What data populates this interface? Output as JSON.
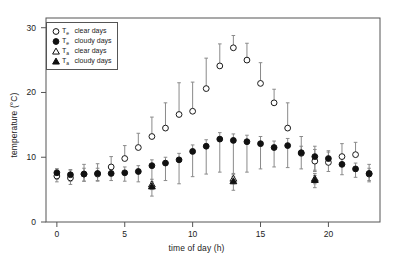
{
  "chart_data": {
    "type": "scatter",
    "title": "",
    "xlabel": "time of day (h)",
    "ylabel": "temperature (°C)",
    "xlim": [
      -0.8,
      23.8
    ],
    "ylim": [
      0,
      31.5
    ],
    "xticks": [
      0,
      5,
      10,
      15,
      20
    ],
    "yticks": [
      0,
      10,
      20,
      30
    ],
    "xtick_labels": [
      "0",
      "5",
      "10",
      "15",
      "20"
    ],
    "ytick_labels": [
      "0",
      "10",
      "20",
      "30"
    ],
    "grid": false,
    "legend_position": "upper-left-inside",
    "error_bars": "asymmetric vertical whisker extending upward from each marker",
    "series": [
      {
        "name": "T_e clear days",
        "label_symbol": "T",
        "label_subscript": "e",
        "label_rest": "clear days",
        "marker": "open-circle",
        "color": "#1a1a1a",
        "fill": "none",
        "x": [
          0,
          1,
          2,
          3,
          4,
          5,
          6,
          7,
          8,
          9,
          10,
          11,
          12,
          13,
          14,
          15,
          16,
          17,
          18,
          19,
          20,
          21,
          22,
          23
        ],
        "values": [
          7.1,
          6.8,
          7.4,
          7.4,
          8.5,
          9.8,
          11.5,
          13.2,
          14.5,
          16.6,
          17.1,
          20.6,
          24.1,
          26.9,
          25.0,
          21.4,
          18.4,
          14.5,
          10.6,
          9.4,
          9.2,
          10.1,
          10.4,
          7.4
        ],
        "err_up": [
          1.1,
          1.3,
          1.5,
          1.6,
          1.6,
          2.0,
          2.2,
          3.0,
          3.9,
          4.9,
          4.5,
          4.7,
          3.4,
          1.9,
          2.6,
          3.2,
          2.1,
          3.9,
          2.6,
          2.3,
          1.8,
          2.0,
          1.9,
          1.5
        ],
        "err_dn": [
          0.9,
          1.0,
          1.1,
          1.1,
          1.0,
          0.0,
          0.0,
          0.0,
          0.0,
          0.0,
          0.0,
          0.0,
          0.0,
          0.0,
          0.0,
          0.0,
          0.0,
          0.0,
          0.0,
          1.4,
          0.0,
          0.0,
          0.0,
          1.2
        ]
      },
      {
        "name": "T_e cloudy days",
        "label_symbol": "T",
        "label_subscript": "e",
        "label_rest": "cloudy days",
        "marker": "filled-circle",
        "color": "#111111",
        "fill": "#111111",
        "x": [
          0,
          1,
          2,
          3,
          4,
          5,
          6,
          7,
          8,
          9,
          10,
          11,
          12,
          13,
          14,
          15,
          16,
          17,
          18,
          19,
          20,
          21,
          22,
          23
        ],
        "values": [
          7.6,
          7.3,
          7.4,
          7.5,
          7.5,
          7.6,
          7.8,
          8.7,
          9.1,
          9.6,
          10.9,
          11.7,
          12.8,
          12.6,
          12.4,
          12.1,
          11.5,
          11.8,
          10.7,
          10.1,
          9.8,
          8.9,
          8.2,
          7.5
        ],
        "err_up": [
          0.6,
          0.7,
          0.9,
          0.8,
          0.8,
          0.9,
          0.9,
          0.9,
          0.9,
          1.0,
          1.0,
          1.0,
          1.0,
          1.0,
          1.0,
          1.1,
          1.0,
          1.1,
          1.0,
          1.1,
          1.0,
          1.0,
          0.9,
          0.8
        ],
        "err_dn": [
          1.0,
          1.0,
          1.1,
          1.1,
          1.1,
          1.3,
          1.6,
          2.7,
          2.7,
          3.7,
          3.9,
          4.3,
          5.1,
          5.3,
          4.7,
          3.9,
          3.0,
          3.4,
          2.5,
          2.3,
          2.0,
          1.6,
          1.3,
          1.1
        ]
      },
      {
        "name": "T_a clear days",
        "label_symbol": "T",
        "label_subscript": "a",
        "label_rest": "clear days",
        "marker": "open-triangle",
        "color": "#1a1a1a",
        "fill": "none",
        "x": [
          7,
          13,
          19
        ],
        "values": [
          5.8,
          6.7,
          6.7
        ],
        "err_up": [
          0.8,
          0.8,
          0.8
        ],
        "err_dn": [
          0.8,
          0.8,
          0.8
        ]
      },
      {
        "name": "T_a cloudy days",
        "label_symbol": "T",
        "label_subscript": "a",
        "label_rest": "cloudy days",
        "marker": "filled-triangle",
        "color": "#111111",
        "fill": "#111111",
        "x": [
          7,
          13,
          19
        ],
        "values": [
          5.5,
          6.3,
          6.5
        ],
        "err_up": [
          0.7,
          0.7,
          0.7
        ],
        "err_dn": [
          1.5,
          1.4,
          1.2
        ]
      }
    ]
  },
  "legend": {
    "entries": [
      {
        "marker": "open-circle",
        "symbol": "T",
        "subscript": "e",
        "text": "clear days"
      },
      {
        "marker": "filled-circle",
        "symbol": "T",
        "subscript": "e",
        "text": "cloudy days"
      },
      {
        "marker": "open-triangle",
        "symbol": "T",
        "subscript": "a",
        "text": "clear days"
      },
      {
        "marker": "filled-triangle",
        "symbol": "T",
        "subscript": "a",
        "text": "cloudy days"
      }
    ]
  }
}
